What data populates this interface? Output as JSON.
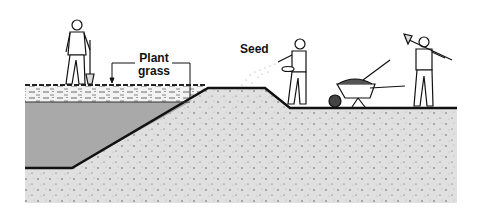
{
  "illustration": {
    "description": "Cross-section of an earthen slope showing workers planting grass and seeding soil",
    "labels": {
      "plant_grass_line1": "Plant",
      "plant_grass_line2": "grass",
      "seed": "Seed"
    },
    "figures": [
      {
        "name": "worker-with-shovel-left",
        "position": "on grass layer, left"
      },
      {
        "name": "worker-sowing-seed",
        "position": "at base of slope"
      },
      {
        "name": "wheelbarrow-with-soil-and-shovel",
        "position": "lower ground"
      },
      {
        "name": "worker-carrying-shovel",
        "position": "lower ground, right"
      }
    ],
    "colors": {
      "soil": "#dedede",
      "fill": "#a8a8a8",
      "line": "#111111",
      "grass_layer": "#f2f2f2"
    }
  }
}
